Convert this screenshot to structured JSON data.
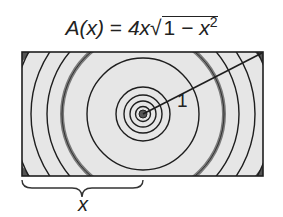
{
  "formula": {
    "lhs": "A(x)",
    "equals": " = ",
    "coef": "4x",
    "sqrt_symbol": "√",
    "radicand_one": "1",
    "minus": " − ",
    "radicand_var": "x",
    "exponent": "2"
  },
  "diagram": {
    "radius_label": "1",
    "width_label": "x",
    "fill_color": "#e6e6e6",
    "stroke_color": "#1e1e1e",
    "thick_ring_color": "#7a7a7a"
  }
}
